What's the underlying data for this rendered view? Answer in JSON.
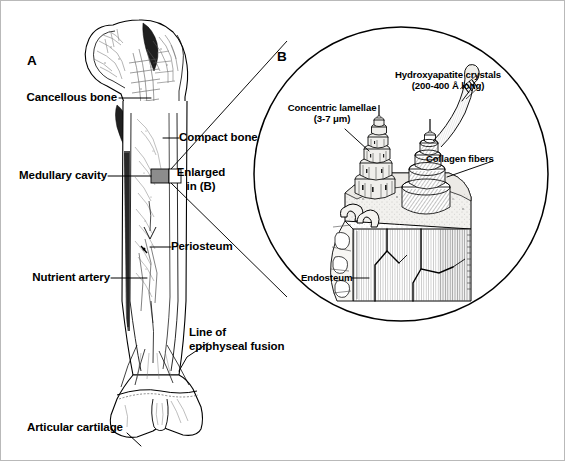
{
  "figure": {
    "background_color": "#ffffff",
    "ink_color": "#000000",
    "border_color": "#b9b9b9",
    "width": 565,
    "height": 461
  },
  "panels": {
    "a": {
      "letter": "A",
      "subject": "longitudinal-section-of-femur",
      "labels": [
        {
          "key": "cancellous_bone",
          "text": "Cancellous bone",
          "align": "right"
        },
        {
          "key": "compact_bone",
          "text": "Compact bone",
          "align": "left"
        },
        {
          "key": "medullary_cavity",
          "text": "Medullary cavity",
          "align": "right"
        },
        {
          "key": "enlarged_in_b",
          "text": "Enlarged\nin (B)",
          "align": "center"
        },
        {
          "key": "periosteum",
          "text": "Periosteum",
          "align": "left"
        },
        {
          "key": "nutrient_artery",
          "text": "Nutrient artery",
          "align": "right"
        },
        {
          "key": "line_of_epiphyseal_fusion",
          "text": "Line of\nepiphyseal fusion",
          "align": "left"
        },
        {
          "key": "articular_cartilage",
          "text": "Articular cartilage",
          "align": "left"
        }
      ]
    },
    "b": {
      "letter": "B",
      "subject": "circular-inset-of-compact-bone-microstructure",
      "labels": [
        {
          "key": "concentric_lamellae",
          "text": "Concentric lamellae\n(3-7 μm)",
          "align": "center"
        },
        {
          "key": "hydroxyapatite_crystals",
          "text": "Hydroxyapatite crystals\n(200-400 Å long)",
          "align": "center"
        },
        {
          "key": "collagen_fibers",
          "text": "Collagen fibers",
          "align": "left"
        },
        {
          "key": "endosteum",
          "text": "Endosteum",
          "align": "left"
        }
      ]
    }
  },
  "colors": {
    "line": "#000000",
    "marker_box_fill": "#8c8c8c",
    "bone_fill": "#ffffff",
    "shade_dark": "#1a1a1a",
    "shade_mid": "#6e6e6e",
    "shade_light": "#cccccc",
    "hatch": "#555555"
  }
}
